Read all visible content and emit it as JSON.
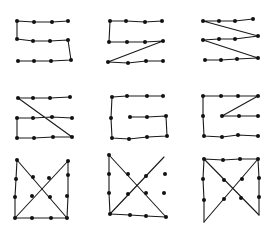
{
  "colors": {
    "ink": "#111111",
    "background": "#ffffff"
  },
  "panels": [
    {
      "id": "s-shape-1",
      "description": "S-like serpentine through 3 rows of 4 dots",
      "dots": [
        [
          17,
          21
        ],
        [
          34,
          22
        ],
        [
          52,
          22
        ],
        [
          68,
          21
        ],
        [
          17,
          39
        ],
        [
          33,
          41
        ],
        [
          50,
          41
        ],
        [
          68,
          40
        ],
        [
          18,
          61
        ],
        [
          34,
          61
        ],
        [
          51,
          61
        ],
        [
          71,
          60
        ]
      ],
      "path": [
        [
          68,
          21
        ],
        [
          52,
          22
        ],
        [
          34,
          22
        ],
        [
          17,
          21
        ],
        [
          17,
          39
        ],
        [
          33,
          41
        ],
        [
          50,
          41
        ],
        [
          68,
          40
        ],
        [
          71,
          60
        ],
        [
          51,
          61
        ],
        [
          34,
          61
        ],
        [
          18,
          61
        ]
      ]
    },
    {
      "id": "s-shape-2",
      "description": "Top row, down-left, middle row, diagonal to bottom-left, bottom row",
      "dots": [
        [
          110,
          21
        ],
        [
          126,
          21
        ],
        [
          145,
          22
        ],
        [
          162,
          21
        ],
        [
          109,
          42
        ],
        [
          127,
          42
        ],
        [
          145,
          42
        ],
        [
          163,
          41
        ],
        [
          108,
          62
        ],
        [
          128,
          63
        ],
        [
          146,
          61
        ],
        [
          163,
          61
        ]
      ],
      "path": [
        [
          162,
          21
        ],
        [
          145,
          22
        ],
        [
          126,
          21
        ],
        [
          110,
          21
        ],
        [
          109,
          42
        ],
        [
          127,
          42
        ],
        [
          145,
          42
        ],
        [
          163,
          41
        ],
        [
          108,
          62
        ],
        [
          128,
          63
        ],
        [
          146,
          61
        ],
        [
          163,
          61
        ]
      ]
    },
    {
      "id": "z-shape",
      "description": "Zig-zag: rows joined by diagonals",
      "dots": [
        [
          203,
          21
        ],
        [
          219,
          21
        ],
        [
          235,
          21
        ],
        [
          253,
          19
        ],
        [
          203,
          40
        ],
        [
          219,
          39
        ],
        [
          235,
          39
        ],
        [
          258,
          36
        ],
        [
          205,
          60
        ],
        [
          221,
          60
        ],
        [
          237,
          59
        ],
        [
          258,
          58
        ]
      ],
      "path": [
        [
          253,
          19
        ],
        [
          235,
          21
        ],
        [
          219,
          21
        ],
        [
          203,
          21
        ],
        [
          258,
          36
        ],
        [
          235,
          39
        ],
        [
          219,
          39
        ],
        [
          203,
          40
        ],
        [
          258,
          58
        ],
        [
          237,
          59
        ],
        [
          221,
          60
        ],
        [
          205,
          60
        ]
      ]
    },
    {
      "id": "z-mixed",
      "description": "Top row, long diagonal, middle and bottom rows joined on left",
      "dots": [
        [
          18,
          98
        ],
        [
          33,
          98
        ],
        [
          50,
          98
        ],
        [
          70,
          97
        ],
        [
          17,
          118
        ],
        [
          33,
          118
        ],
        [
          52,
          117
        ],
        [
          72,
          118
        ],
        [
          17,
          138
        ],
        [
          34,
          138
        ],
        [
          53,
          137
        ],
        [
          72,
          137
        ]
      ],
      "path": [
        [
          70,
          97
        ],
        [
          50,
          98
        ],
        [
          33,
          98
        ],
        [
          18,
          98
        ],
        [
          72,
          137
        ],
        [
          53,
          137
        ],
        [
          34,
          138
        ],
        [
          17,
          138
        ],
        [
          17,
          118
        ],
        [
          33,
          118
        ],
        [
          52,
          117
        ],
        [
          72,
          118
        ]
      ]
    },
    {
      "id": "spiral",
      "description": "Spiral inward from top right",
      "dots": [
        [
          112,
          97
        ],
        [
          127,
          96
        ],
        [
          147,
          96
        ],
        [
          163,
          96
        ],
        [
          111,
          118
        ],
        [
          130,
          117
        ],
        [
          147,
          117
        ],
        [
          166,
          116
        ],
        [
          112,
          138
        ],
        [
          129,
          139
        ],
        [
          147,
          137
        ],
        [
          167,
          136
        ]
      ],
      "path": [
        [
          163,
          96
        ],
        [
          147,
          96
        ],
        [
          127,
          96
        ],
        [
          112,
          97
        ],
        [
          111,
          118
        ],
        [
          112,
          138
        ],
        [
          129,
          139
        ],
        [
          147,
          137
        ],
        [
          167,
          136
        ],
        [
          166,
          116
        ],
        [
          147,
          117
        ],
        [
          130,
          117
        ]
      ]
    },
    {
      "id": "spiral-diagonal",
      "description": "Spiral variant with diagonal to middle",
      "dots": [
        [
          203,
          96
        ],
        [
          221,
          96
        ],
        [
          238,
          96
        ],
        [
          258,
          96
        ],
        [
          203,
          116
        ],
        [
          222,
          116
        ],
        [
          239,
          116
        ],
        [
          258,
          116
        ],
        [
          204,
          136
        ],
        [
          222,
          137
        ],
        [
          238,
          135
        ],
        [
          258,
          136
        ]
      ],
      "path": [
        [
          258,
          136
        ],
        [
          238,
          135
        ],
        [
          222,
          137
        ],
        [
          204,
          136
        ],
        [
          203,
          116
        ],
        [
          203,
          96
        ],
        [
          221,
          96
        ],
        [
          238,
          96
        ],
        [
          258,
          96
        ],
        [
          222,
          116
        ],
        [
          239,
          116
        ],
        [
          258,
          116
        ]
      ]
    },
    {
      "id": "bowtie-1",
      "description": "Crossing diagonals with closed bottom and sides",
      "dots": [
        [
          17,
          160
        ],
        [
          16,
          179
        ],
        [
          15,
          197
        ],
        [
          33,
          177
        ],
        [
          49,
          178
        ],
        [
          32,
          196
        ],
        [
          50,
          197
        ],
        [
          68,
          161
        ],
        [
          68,
          175
        ],
        [
          67,
          196
        ],
        [
          15,
          218
        ],
        [
          32,
          218
        ],
        [
          51,
          218
        ],
        [
          67,
          218
        ]
      ],
      "path": [
        [
          68,
          161
        ],
        [
          15,
          218
        ],
        [
          32,
          218
        ],
        [
          51,
          218
        ],
        [
          67,
          218
        ],
        [
          68,
          196
        ],
        [
          68,
          175
        ],
        [
          68,
          161
        ]
      ],
      "path2": [
        [
          17,
          160
        ],
        [
          16,
          179
        ],
        [
          15,
          197
        ],
        [
          15,
          218
        ]
      ],
      "path3": [
        [
          17,
          160
        ],
        [
          67,
          218
        ]
      ]
    },
    {
      "id": "bowtie-2",
      "description": "Crossing diagonals, left side and bottom",
      "dots": [
        [
          109,
          155
        ],
        [
          109,
          174
        ],
        [
          109,
          193
        ],
        [
          128,
          174
        ],
        [
          146,
          176
        ],
        [
          128,
          194
        ],
        [
          146,
          193
        ],
        [
          165,
          174
        ],
        [
          164,
          193
        ],
        [
          110,
          214
        ],
        [
          130,
          215
        ],
        [
          146,
          216
        ],
        [
          166,
          217
        ]
      ],
      "path": [
        [
          109,
          155
        ],
        [
          109,
          174
        ],
        [
          109,
          193
        ],
        [
          110,
          214
        ],
        [
          164,
          157
        ]
      ],
      "path2": [
        [
          109,
          155
        ],
        [
          166,
          217
        ],
        [
          146,
          216
        ],
        [
          130,
          215
        ],
        [
          110,
          214
        ]
      ]
    },
    {
      "id": "bowtie-3",
      "description": "Top row closed, crossing diagonals, open bottom",
      "dots": [
        [
          204,
          159
        ],
        [
          223,
          160
        ],
        [
          240,
          159
        ],
        [
          258,
          159
        ],
        [
          203,
          179
        ],
        [
          224,
          180
        ],
        [
          242,
          179
        ],
        [
          259,
          178
        ],
        [
          204,
          200
        ],
        [
          224,
          199
        ],
        [
          241,
          198
        ],
        [
          259,
          197
        ]
      ],
      "path": [
        [
          204,
          222
        ],
        [
          204,
          200
        ],
        [
          203,
          179
        ],
        [
          204,
          159
        ],
        [
          223,
          160
        ],
        [
          240,
          159
        ],
        [
          258,
          159
        ],
        [
          259,
          178
        ],
        [
          259,
          197
        ],
        [
          259,
          215
        ]
      ],
      "path2": [
        [
          204,
          159
        ],
        [
          259,
          215
        ]
      ],
      "path3": [
        [
          258,
          159
        ],
        [
          204,
          222
        ]
      ]
    }
  ]
}
